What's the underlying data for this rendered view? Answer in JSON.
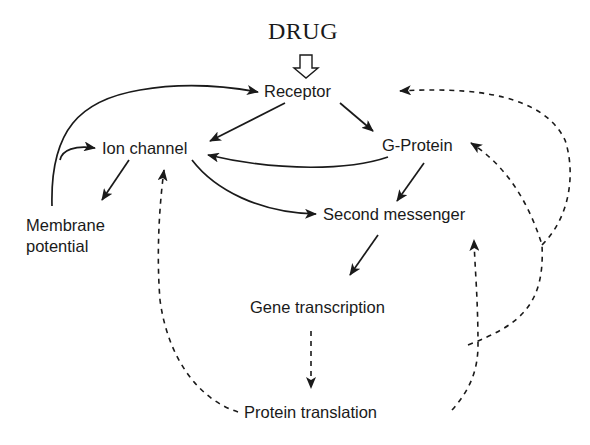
{
  "diagram": {
    "title": "DRUG",
    "nodes": {
      "receptor": "Receptor",
      "ion_channel": "Ion channel",
      "g_protein": "G-Protein",
      "membrane_potential_line1": "Membrane",
      "membrane_potential_line2": "potential",
      "second_messenger": "Second messenger",
      "gene_transcription": "Gene transcription",
      "protein_translation": "Protein translation"
    },
    "edges": [
      {
        "from": "DRUG",
        "to": "Receptor",
        "style": "hollow-arrow"
      },
      {
        "from": "Receptor",
        "to": "Ion channel",
        "style": "solid"
      },
      {
        "from": "Receptor",
        "to": "G-Protein",
        "style": "solid"
      },
      {
        "from": "G-Protein",
        "to": "Ion channel",
        "style": "solid"
      },
      {
        "from": "G-Protein",
        "to": "Second messenger",
        "style": "solid"
      },
      {
        "from": "Ion channel",
        "to": "Second messenger",
        "style": "solid"
      },
      {
        "from": "Ion channel",
        "to": "Membrane potential",
        "style": "solid"
      },
      {
        "from": "Membrane potential",
        "to": "Ion channel",
        "style": "solid"
      },
      {
        "from": "Membrane potential",
        "to": "Receptor",
        "style": "solid"
      },
      {
        "from": "Second messenger",
        "to": "Gene transcription",
        "style": "solid"
      },
      {
        "from": "Gene transcription",
        "to": "Protein translation",
        "style": "dashed"
      },
      {
        "from": "Protein translation",
        "to": "Ion channel",
        "style": "dashed"
      },
      {
        "from": "Protein translation",
        "to": "Second messenger",
        "style": "dashed"
      },
      {
        "from": "Protein translation",
        "to": "G-Protein",
        "style": "dashed"
      },
      {
        "from": "Protein translation",
        "to": "Receptor",
        "style": "dashed"
      }
    ]
  }
}
